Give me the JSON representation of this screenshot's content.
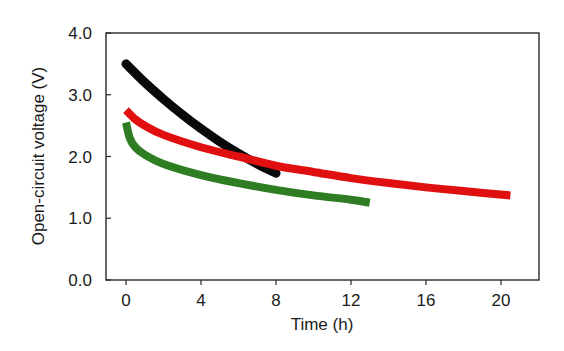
{
  "chart_data": {
    "type": "line",
    "title": "",
    "xlabel": "Time (h)",
    "ylabel": "Open-circuit voltage (V)",
    "xlim": [
      -1,
      22
    ],
    "ylim": [
      0.0,
      4.0
    ],
    "xticks": [
      0,
      4,
      8,
      12,
      16,
      20
    ],
    "xtick_labels": [
      "0",
      "4",
      "8",
      "12",
      "16",
      "20"
    ],
    "yticks": [
      0.0,
      1.0,
      2.0,
      3.0,
      4.0
    ],
    "ytick_labels": [
      "0.0",
      "1.0",
      "2.0",
      "3.0",
      "4.0"
    ],
    "grid": false,
    "legend": null,
    "series": [
      {
        "name": "black",
        "color": "#0a0a0a",
        "x": [
          0,
          1,
          2,
          3,
          4,
          5,
          6,
          7,
          8
        ],
        "y": [
          3.5,
          3.2,
          2.93,
          2.68,
          2.45,
          2.24,
          2.05,
          1.88,
          1.73
        ]
      },
      {
        "name": "red",
        "color": "#e01010",
        "x": [
          0,
          0.5,
          1,
          2,
          4,
          6,
          8,
          10,
          12,
          14,
          16,
          18,
          20.5
        ],
        "y": [
          2.75,
          2.6,
          2.5,
          2.35,
          2.15,
          2.0,
          1.85,
          1.75,
          1.65,
          1.57,
          1.5,
          1.44,
          1.37
        ]
      },
      {
        "name": "green",
        "color": "#2e7d22",
        "x": [
          0,
          0.2,
          0.5,
          1,
          2,
          4,
          6,
          8,
          10,
          12,
          13
        ],
        "y": [
          2.55,
          2.3,
          2.15,
          2.03,
          1.88,
          1.7,
          1.57,
          1.46,
          1.37,
          1.3,
          1.25
        ]
      }
    ]
  }
}
